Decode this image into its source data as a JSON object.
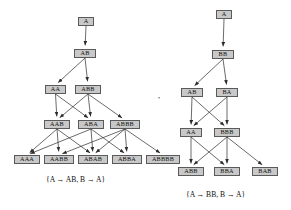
{
  "figure": {
    "background_color": "#ffffff",
    "node_fill_color": "#c8c8c8",
    "node_border_color": "#5a5a5a",
    "text_color": "#111111",
    "separator": ","
  },
  "trees": [
    {
      "id": "left-tree",
      "caption": "{A → AB, B → A}",
      "caption_x": 46,
      "caption_y": 175,
      "levels": [
        {
          "index": 0,
          "nodes": [
            {
              "label": "A",
              "x": 78,
              "y": 17,
              "w": 16
            }
          ]
        },
        {
          "index": 1,
          "nodes": [
            {
              "label": "AB",
              "x": 74,
              "y": 49,
              "w": 22
            }
          ]
        },
        {
          "index": 2,
          "nodes": [
            {
              "label": "AA",
              "x": 45,
              "y": 85,
              "w": 21
            },
            {
              "label": "ABB",
              "x": 75,
              "y": 85,
              "w": 26
            }
          ]
        },
        {
          "index": 3,
          "nodes": [
            {
              "label": "AAB",
              "x": 44,
              "y": 120,
              "w": 26
            },
            {
              "label": "ABA",
              "x": 78,
              "y": 120,
              "w": 26
            },
            {
              "label": "ABBB",
              "x": 110,
              "y": 120,
              "w": 30
            }
          ]
        },
        {
          "index": 4,
          "nodes": [
            {
              "label": "AAA",
              "x": 14,
              "y": 155,
              "w": 26
            },
            {
              "label": "AABB",
              "x": 44,
              "y": 155,
              "w": 30
            },
            {
              "label": "ABAB",
              "x": 78,
              "y": 155,
              "w": 30
            },
            {
              "label": "ABBA",
              "x": 112,
              "y": 155,
              "w": 30
            },
            {
              "label": "ABBBB",
              "x": 146,
              "y": 155,
              "w": 34
            }
          ]
        }
      ],
      "edges": [
        {
          "from": "A",
          "to": "AB"
        },
        {
          "from": "AB",
          "to": "AA"
        },
        {
          "from": "AB",
          "to": "ABB"
        },
        {
          "from": "AA",
          "to": "AAB"
        },
        {
          "from": "AA",
          "to": "ABA"
        },
        {
          "from": "ABB",
          "to": "AAB"
        },
        {
          "from": "ABB",
          "to": "ABA"
        },
        {
          "from": "ABB",
          "to": "ABBB"
        },
        {
          "from": "AAB",
          "to": "AAA"
        },
        {
          "from": "AAB",
          "to": "AABB"
        },
        {
          "from": "AAB",
          "to": "ABAB"
        },
        {
          "from": "ABA",
          "to": "AAA"
        },
        {
          "from": "ABA",
          "to": "ABAB"
        },
        {
          "from": "ABA",
          "to": "ABBA"
        },
        {
          "from": "ABBB",
          "to": "AABB"
        },
        {
          "from": "ABBB",
          "to": "ABAB"
        },
        {
          "from": "ABBB",
          "to": "ABBA"
        },
        {
          "from": "ABBB",
          "to": "ABBBB"
        }
      ]
    },
    {
      "id": "right-tree",
      "caption": "{A → BB, B → A}",
      "caption_x": 186,
      "caption_y": 190,
      "levels": [
        {
          "index": 0,
          "nodes": [
            {
              "label": "A",
              "x": 216,
              "y": 10,
              "w": 16
            }
          ]
        },
        {
          "index": 1,
          "nodes": [
            {
              "label": "BB",
              "x": 212,
              "y": 50,
              "w": 22
            }
          ]
        },
        {
          "index": 2,
          "nodes": [
            {
              "label": "AB",
              "x": 181,
              "y": 88,
              "w": 22
            },
            {
              "label": "BA",
              "x": 216,
              "y": 88,
              "w": 22
            }
          ]
        },
        {
          "index": 3,
          "nodes": [
            {
              "label": "AA",
              "x": 180,
              "y": 128,
              "w": 22
            },
            {
              "label": "BBB",
              "x": 214,
              "y": 128,
              "w": 26
            }
          ]
        },
        {
          "index": 4,
          "nodes": [
            {
              "label": "ABB",
              "x": 178,
              "y": 167,
              "w": 26
            },
            {
              "label": "BBA",
              "x": 214,
              "y": 167,
              "w": 26
            },
            {
              "label": "BAB",
              "x": 252,
              "y": 167,
              "w": 26
            }
          ]
        }
      ],
      "edges": [
        {
          "from": "A",
          "to": "BB"
        },
        {
          "from": "BB",
          "to": "AB"
        },
        {
          "from": "BB",
          "to": "BA"
        },
        {
          "from": "AB",
          "to": "AA"
        },
        {
          "from": "AB",
          "to": "BBB"
        },
        {
          "from": "BA",
          "to": "AA"
        },
        {
          "from": "BA",
          "to": "BBB"
        },
        {
          "from": "AA",
          "to": "ABB"
        },
        {
          "from": "AA",
          "to": "BBA"
        },
        {
          "from": "BBB",
          "to": "ABB"
        },
        {
          "from": "BBB",
          "to": "BBA"
        },
        {
          "from": "BBB",
          "to": "BAB"
        }
      ]
    }
  ],
  "separator_marker": {
    "text": ",",
    "x": 158,
    "y": 91
  }
}
